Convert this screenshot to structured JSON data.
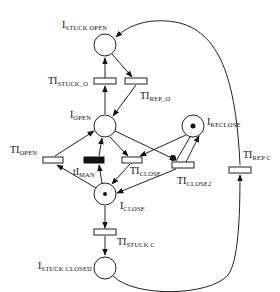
{
  "diagram": {
    "type": "petri-net",
    "colors": {
      "stroke": "#222222",
      "fill": "#ffffff",
      "token": "#111111",
      "immediate_transition": "#111111"
    },
    "places": [
      {
        "id": "stuck_open",
        "label_main": "I",
        "label_sub": "STUCK OPEN",
        "x": 105,
        "y": 45,
        "token": false
      },
      {
        "id": "open",
        "label_main": "I",
        "label_sub": "OPEN",
        "x": 105,
        "y": 126,
        "token": false
      },
      {
        "id": "reclose",
        "label_main": "I",
        "label_sub": "RECLOSE",
        "x": 193,
        "y": 126,
        "token": true
      },
      {
        "id": "close",
        "label_main": "I",
        "label_sub": "CLOSE",
        "x": 105,
        "y": 194,
        "token": true
      },
      {
        "id": "stuck_closed",
        "label_main": "I",
        "label_sub": "STUCK CLOSED",
        "x": 105,
        "y": 268,
        "token": false
      }
    ],
    "transitions": [
      {
        "id": "stuck_o",
        "label_main": "TI",
        "label_sub": "STUCK_O",
        "x": 105,
        "y": 81,
        "immediate": false
      },
      {
        "id": "rep_o",
        "label_main": "TI",
        "label_sub": "REP_O",
        "x": 136,
        "y": 81,
        "immediate": false
      },
      {
        "id": "open_t",
        "label_main": "TI",
        "label_sub": "OPEN",
        "x": 53,
        "y": 160,
        "immediate": false
      },
      {
        "id": "man",
        "label_main": "tI",
        "label_sub": "MAN",
        "x": 97,
        "y": 160,
        "immediate": true
      },
      {
        "id": "close_t",
        "label_main": "TI",
        "label_sub": "CLOSE",
        "x": 132,
        "y": 160,
        "immediate": false
      },
      {
        "id": "close2",
        "label_main": "TI",
        "label_sub": "CLOSE2",
        "x": 183,
        "y": 165,
        "immediate": false
      },
      {
        "id": "stuck_c",
        "label_main": "TI",
        "label_sub": "STUCK C",
        "x": 105,
        "y": 232,
        "immediate": false
      },
      {
        "id": "rep_c",
        "label_main": "TI",
        "label_sub": "REP C",
        "x": 240,
        "y": 170,
        "immediate": false
      }
    ]
  }
}
